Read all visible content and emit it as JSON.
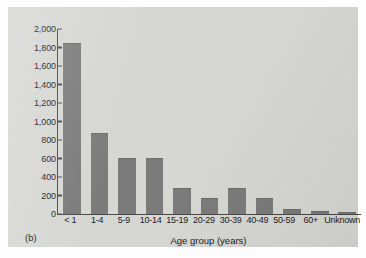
{
  "figure": {
    "panel_letter": "(b)",
    "colors": {
      "bar": "#7b7b7b",
      "axis": "#4a4a4a",
      "panel_background": "#d6d6d3",
      "page_background": "#fdfdfd",
      "text": "#1d1d1d"
    }
  },
  "chart_data": {
    "type": "bar",
    "title": "",
    "xlabel": "Age group (years)",
    "ylabel": "Reported cases",
    "categories": [
      "< 1",
      "1-4",
      "5-9",
      "10-14",
      "15-19",
      "20-29",
      "30-39",
      "40-49",
      "50-59",
      "60+",
      "Unknown"
    ],
    "values": [
      1850,
      875,
      605,
      610,
      280,
      175,
      285,
      175,
      50,
      30,
      20
    ],
    "ylim": [
      0,
      2000
    ],
    "ytick_values": [
      0,
      200,
      400,
      600,
      800,
      1000,
      1200,
      1400,
      1600,
      1800,
      2000
    ],
    "ytick_labels": [
      "0",
      "200",
      "400",
      "600",
      "800",
      "1,000",
      "1,200",
      "1,400",
      "1,600",
      "1,800",
      "2,000"
    ],
    "grid": false,
    "legend": null,
    "legend_position": "none",
    "annotations": [
      "(b)"
    ]
  }
}
